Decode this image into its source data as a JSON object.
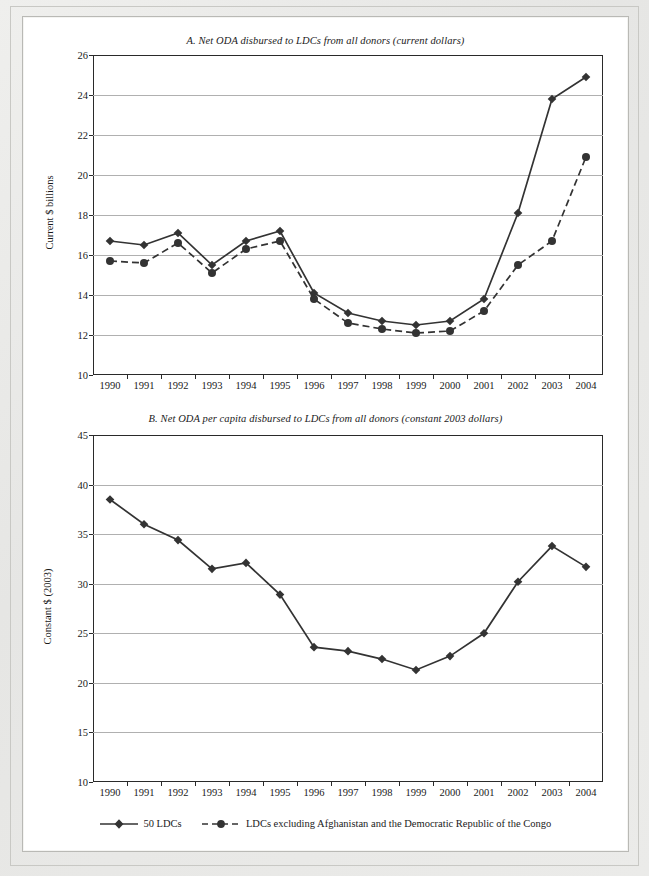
{
  "figure": {
    "legend": {
      "series1_label": "50 LDCs",
      "series2_label": "LDCs excluding Afghanistan and the Democratic Republic of the Congo"
    }
  },
  "chart_data": [
    {
      "type": "line",
      "panel": "A",
      "title": "A. Net ODA disbursed to LDCs from all donors (current dollars)",
      "xlabel": "",
      "ylabel": "Current $ billions",
      "categories": [
        "1990",
        "1991",
        "1992",
        "1993",
        "1994",
        "1995",
        "1996",
        "1997",
        "1998",
        "1999",
        "2000",
        "2001",
        "2002",
        "2003",
        "2004"
      ],
      "x": [
        1990,
        1991,
        1992,
        1993,
        1994,
        1995,
        1996,
        1997,
        1998,
        1999,
        2000,
        2001,
        2002,
        2003,
        2004
      ],
      "ylim": [
        10,
        26
      ],
      "yticks": [
        10,
        12,
        14,
        16,
        18,
        20,
        22,
        24,
        26
      ],
      "grid": true,
      "legend_position": "below-figure",
      "series": [
        {
          "name": "50 LDCs",
          "marker": "diamond",
          "linestyle": "solid",
          "values": [
            16.7,
            16.5,
            17.1,
            15.5,
            16.7,
            17.2,
            14.1,
            13.1,
            12.7,
            12.5,
            12.7,
            13.8,
            18.1,
            23.8,
            24.9
          ]
        },
        {
          "name": "LDCs excluding Afghanistan and the Democratic Republic of the Congo",
          "marker": "circle",
          "linestyle": "dashed",
          "values": [
            15.7,
            15.6,
            16.6,
            15.1,
            16.3,
            16.7,
            13.8,
            12.6,
            12.3,
            12.1,
            12.2,
            13.2,
            15.5,
            16.7,
            20.9
          ]
        }
      ]
    },
    {
      "type": "line",
      "panel": "B",
      "title": "B. Net ODA per capita disbursed to LDCs from all donors (constant 2003 dollars)",
      "xlabel": "",
      "ylabel": "Constant $ (2003)",
      "categories": [
        "1990",
        "1991",
        "1992",
        "1993",
        "1994",
        "1995",
        "1996",
        "1997",
        "1998",
        "1999",
        "2000",
        "2001",
        "2002",
        "2003",
        "2004"
      ],
      "x": [
        1990,
        1991,
        1992,
        1993,
        1994,
        1995,
        1996,
        1997,
        1998,
        1999,
        2000,
        2001,
        2002,
        2003,
        2004
      ],
      "ylim": [
        10,
        45
      ],
      "yticks": [
        10,
        15,
        20,
        25,
        30,
        35,
        40,
        45
      ],
      "grid": true,
      "legend_position": "below-figure",
      "series": [
        {
          "name": "50 LDCs",
          "marker": "diamond",
          "linestyle": "solid",
          "values": [
            38.5,
            36.0,
            34.4,
            31.5,
            32.1,
            28.9,
            23.6,
            23.2,
            22.4,
            21.3,
            22.7,
            25.0,
            30.2,
            33.8,
            31.7
          ]
        }
      ]
    }
  ]
}
